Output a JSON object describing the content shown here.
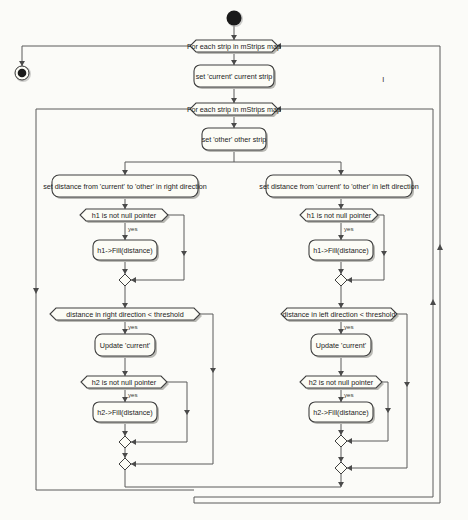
{
  "diagram": {
    "type": "activity-diagram",
    "nodes": {
      "start": {
        "kind": "start"
      },
      "end": {
        "kind": "end"
      },
      "loop_outer": {
        "kind": "loop",
        "label": "For each strip in mStrips map"
      },
      "set_current": {
        "kind": "action",
        "label": "set 'current' current strip"
      },
      "loop_inner": {
        "kind": "loop",
        "label": "For each strip in mStrips map"
      },
      "set_other": {
        "kind": "action",
        "label": "set 'other' other strip"
      },
      "right": {
        "set_distance": {
          "kind": "action",
          "label": "set distance from 'current' to 'other' in right direction"
        },
        "h1_check": {
          "kind": "decision",
          "label": "h1 is not null pointer",
          "yes_label": "yes"
        },
        "h1_fill": {
          "kind": "action",
          "label": "h1->Fill(distance)"
        },
        "threshold_check": {
          "kind": "decision",
          "label": "distance in right direction < threshold",
          "yes_label": "yes"
        },
        "update_current": {
          "kind": "action",
          "label": "Update 'current'"
        },
        "h2_check": {
          "kind": "decision",
          "label": "h2 is not null pointer",
          "yes_label": "yes"
        },
        "h2_fill": {
          "kind": "action",
          "label": "h2->Fill(distance)"
        }
      },
      "left": {
        "set_distance": {
          "kind": "action",
          "label": "set distance from 'current' to 'other' in left direction"
        },
        "h1_check": {
          "kind": "decision",
          "label": "h1 is not null pointer",
          "yes_label": "yes"
        },
        "h1_fill": {
          "kind": "action",
          "label": "h1->Fill(distance)"
        },
        "threshold_check": {
          "kind": "decision",
          "label": "distance in left direction < threshold",
          "yes_label": "yes"
        },
        "update_current": {
          "kind": "action",
          "label": "Update 'current'"
        },
        "h2_check": {
          "kind": "decision",
          "label": "h2 is not null pointer",
          "yes_label": "yes"
        },
        "h2_fill": {
          "kind": "action",
          "label": "h2->Fill(distance)"
        }
      }
    },
    "stray_mark": "ı",
    "colors": {
      "background": "#fbfbf8",
      "node_fill": "#fcfcf6",
      "node_border": "#3f3f3f",
      "edge": "#5a5a5a",
      "start_fill": "#1a1a1a"
    }
  }
}
